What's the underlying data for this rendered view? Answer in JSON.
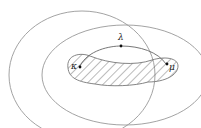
{
  "diagram": {
    "points": [
      {
        "id": "kappa",
        "label": "κ"
      },
      {
        "id": "lambda",
        "label": "λ"
      },
      {
        "id": "mu",
        "label": "μ"
      }
    ],
    "colors": {
      "stroke": "#888888",
      "hatch": "#555555",
      "point": "#111111"
    }
  }
}
